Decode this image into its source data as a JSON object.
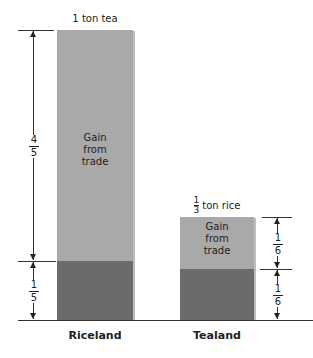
{
  "riceland": {
    "name": "Riceland",
    "top_label": "1 ton tea",
    "gain_label": [
      "Gain",
      "from",
      "trade"
    ],
    "gain_fraction": {
      "num": "4",
      "den": "5"
    },
    "base_fraction": {
      "num": "1",
      "den": "5"
    }
  },
  "tealand": {
    "name": "Tealand",
    "top_label_frac": {
      "num": "1",
      "den": "3"
    },
    "top_label_text": "ton rice",
    "gain_label": [
      "Gain",
      "from",
      "trade"
    ],
    "gain_fraction": {
      "num": "1",
      "den": "6"
    },
    "base_fraction": {
      "num": "1",
      "den": "6"
    }
  },
  "colors": {
    "gain": "#a9a9a9",
    "base": "#6b6b6b"
  }
}
